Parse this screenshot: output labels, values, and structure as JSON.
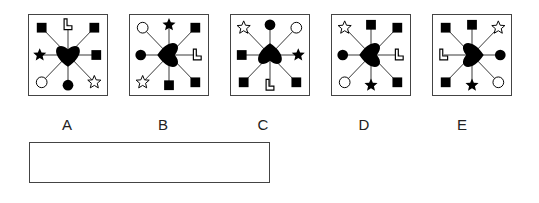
{
  "puzzle": {
    "options": [
      {
        "label": "A",
        "heart_rotation": 0,
        "positions": {
          "top_left": "filled-square",
          "top": "outline-L",
          "top_right": "filled-square",
          "right": "filled-square",
          "bottom_right": "outline-star",
          "bottom": "filled-circle",
          "bottom_left": "outline-circle",
          "left": "filled-star"
        }
      },
      {
        "label": "B",
        "heart_rotation": 90,
        "positions": {
          "top_left": "outline-circle",
          "top": "filled-star",
          "top_right": "filled-square",
          "right": "outline-L",
          "bottom_right": "filled-square",
          "bottom": "filled-square",
          "bottom_left": "outline-star",
          "left": "filled-circle"
        }
      },
      {
        "label": "C",
        "heart_rotation": 180,
        "positions": {
          "top_left": "outline-star",
          "top": "filled-circle",
          "top_right": "outline-circle",
          "right": "filled-star",
          "bottom_right": "filled-square",
          "bottom": "outline-L",
          "bottom_left": "filled-square",
          "left": "filled-square"
        }
      },
      {
        "label": "D",
        "heart_rotation": 90,
        "positions": {
          "top_left": "outline-star",
          "top": "filled-square",
          "top_right": "filled-square",
          "right": "outline-L",
          "bottom_right": "filled-square",
          "bottom": "filled-star",
          "bottom_left": "outline-circle",
          "left": "filled-circle"
        }
      },
      {
        "label": "E",
        "heart_rotation": -90,
        "positions": {
          "top_left": "filled-square",
          "top": "filled-square",
          "top_right": "outline-star",
          "right": "filled-circle",
          "bottom_right": "outline-circle",
          "bottom": "filled-star",
          "bottom_left": "filled-square",
          "left": "outline-L"
        }
      }
    ],
    "answer_box": {
      "value": ""
    },
    "colors": {
      "ink": "#000000",
      "border": "#444444",
      "background": "#ffffff"
    }
  }
}
